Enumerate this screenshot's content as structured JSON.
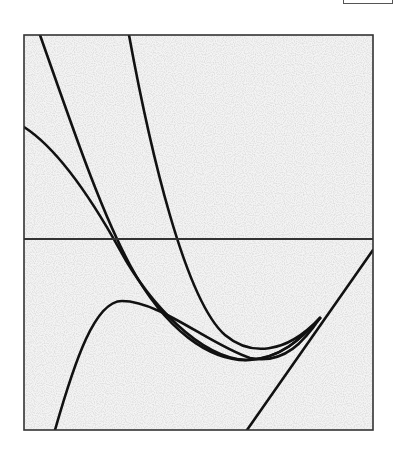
{
  "chart_data": {
    "type": "line",
    "title": "",
    "xlabel": "",
    "ylabel": "",
    "grid": false,
    "legend": null,
    "frame": {
      "x": 24,
      "y": 35,
      "width": 349,
      "height": 395,
      "stroke": "#333333"
    },
    "axis_line": {
      "orientation": "horizontal",
      "y_px": 239,
      "stroke": "#333333"
    },
    "curve_color": "#111111",
    "series": [
      {
        "name": "steep-parabola",
        "description": "steep curve descending from top, minimum near (265,352), rising to meet tangent",
        "path": "M 129 35 C 150 150, 185 300, 225 335 C 250 356, 285 355, 320 318"
      },
      {
        "name": "function-from-top-left",
        "description": "curve from top-left corner, crossing axis near x=118, minimum near (245,360)",
        "path": "M 40 35 C 70 120, 100 210, 130 265 C 165 330, 210 362, 250 360 C 280 358, 300 340, 320 318"
      },
      {
        "name": "gentle-curve-from-left",
        "description": "curve starting at left edge y=127, crossing axis near x=117, merging at lower minimum",
        "path": "M 24 127 C 60 150, 95 205, 120 250 C 150 305, 200 357, 245 360 C 280 360, 302 338, 320 318"
      },
      {
        "name": "cubic-with-local-max",
        "description": "rises from bottom at x=55, local max near (122,301), descends to meet others near (250,360)",
        "path": "M 55 430 C 75 360, 95 301, 122 301 C 160 301, 210 345, 250 358 C 285 365, 305 340, 320 318"
      },
      {
        "name": "tangent-line",
        "description": "straight line from bottom (247,430) to upper right (373,250)",
        "path": "M 247 430 L 373 250"
      }
    ],
    "annotations": []
  }
}
